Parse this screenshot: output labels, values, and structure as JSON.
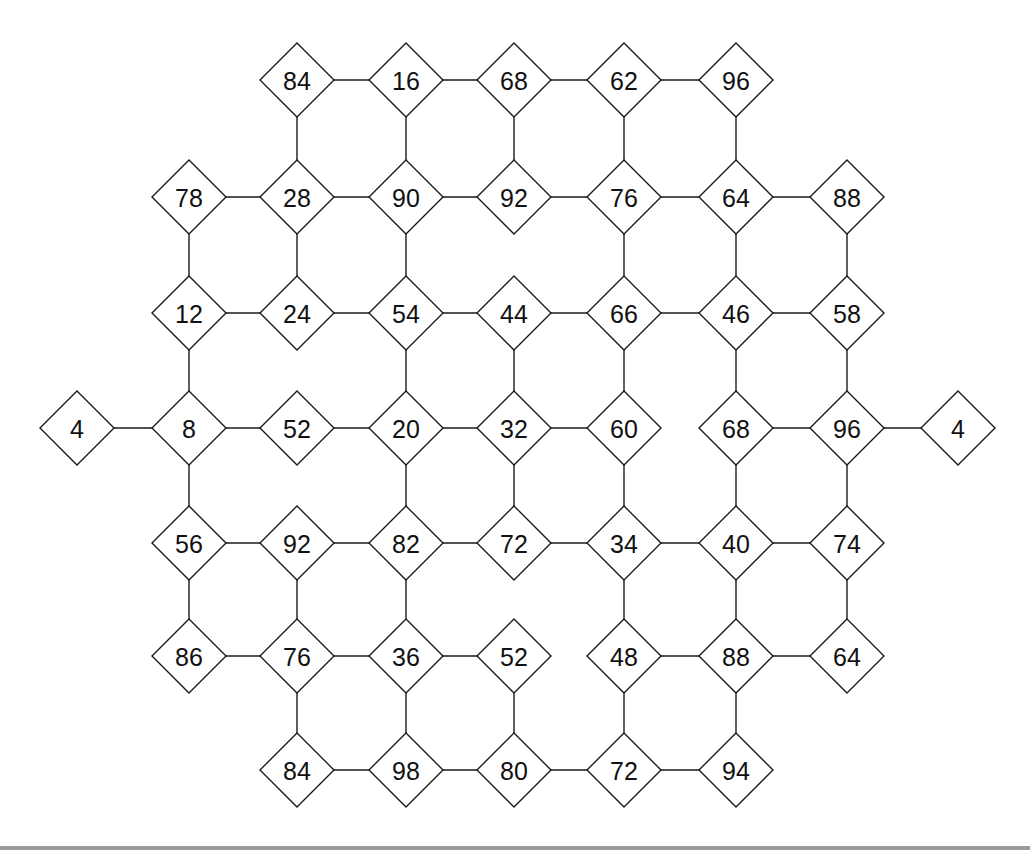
{
  "diagram": {
    "type": "number-grid-graph",
    "node_shape": "diamond",
    "colors": {
      "stroke": "#1a1a1a",
      "fill": "#ffffff",
      "text": "#111111"
    },
    "columns_x": [
      77,
      189,
      297,
      406,
      514,
      624,
      736,
      847,
      958
    ],
    "rows_y": [
      80,
      197,
      313,
      428,
      543,
      656,
      770
    ],
    "nodes": [
      {
        "id": "r0c2",
        "row": 0,
        "col": 2,
        "label": "84"
      },
      {
        "id": "r0c3",
        "row": 0,
        "col": 3,
        "label": "16"
      },
      {
        "id": "r0c4",
        "row": 0,
        "col": 4,
        "label": "68"
      },
      {
        "id": "r0c5",
        "row": 0,
        "col": 5,
        "label": "62"
      },
      {
        "id": "r0c6",
        "row": 0,
        "col": 6,
        "label": "96"
      },
      {
        "id": "r1c1",
        "row": 1,
        "col": 1,
        "label": "78"
      },
      {
        "id": "r1c2",
        "row": 1,
        "col": 2,
        "label": "28"
      },
      {
        "id": "r1c3",
        "row": 1,
        "col": 3,
        "label": "90"
      },
      {
        "id": "r1c4",
        "row": 1,
        "col": 4,
        "label": "92"
      },
      {
        "id": "r1c5",
        "row": 1,
        "col": 5,
        "label": "76"
      },
      {
        "id": "r1c6",
        "row": 1,
        "col": 6,
        "label": "64"
      },
      {
        "id": "r1c7",
        "row": 1,
        "col": 7,
        "label": "88"
      },
      {
        "id": "r2c1",
        "row": 2,
        "col": 1,
        "label": "12"
      },
      {
        "id": "r2c2",
        "row": 2,
        "col": 2,
        "label": "24"
      },
      {
        "id": "r2c3",
        "row": 2,
        "col": 3,
        "label": "54"
      },
      {
        "id": "r2c4",
        "row": 2,
        "col": 4,
        "label": "44"
      },
      {
        "id": "r2c5",
        "row": 2,
        "col": 5,
        "label": "66"
      },
      {
        "id": "r2c6",
        "row": 2,
        "col": 6,
        "label": "46"
      },
      {
        "id": "r2c7",
        "row": 2,
        "col": 7,
        "label": "58"
      },
      {
        "id": "r3c0",
        "row": 3,
        "col": 0,
        "label": "4"
      },
      {
        "id": "r3c1",
        "row": 3,
        "col": 1,
        "label": "8"
      },
      {
        "id": "r3c2",
        "row": 3,
        "col": 2,
        "label": "52"
      },
      {
        "id": "r3c3",
        "row": 3,
        "col": 3,
        "label": "20"
      },
      {
        "id": "r3c4",
        "row": 3,
        "col": 4,
        "label": "32"
      },
      {
        "id": "r3c5",
        "row": 3,
        "col": 5,
        "label": "60"
      },
      {
        "id": "r3c6",
        "row": 3,
        "col": 6,
        "label": "68"
      },
      {
        "id": "r3c7",
        "row": 3,
        "col": 7,
        "label": "96"
      },
      {
        "id": "r3c8",
        "row": 3,
        "col": 8,
        "label": "4"
      },
      {
        "id": "r4c1",
        "row": 4,
        "col": 1,
        "label": "56"
      },
      {
        "id": "r4c2",
        "row": 4,
        "col": 2,
        "label": "92"
      },
      {
        "id": "r4c3",
        "row": 4,
        "col": 3,
        "label": "82"
      },
      {
        "id": "r4c4",
        "row": 4,
        "col": 4,
        "label": "72"
      },
      {
        "id": "r4c5",
        "row": 4,
        "col": 5,
        "label": "34"
      },
      {
        "id": "r4c6",
        "row": 4,
        "col": 6,
        "label": "40"
      },
      {
        "id": "r4c7",
        "row": 4,
        "col": 7,
        "label": "74"
      },
      {
        "id": "r5c1",
        "row": 5,
        "col": 1,
        "label": "86"
      },
      {
        "id": "r5c2",
        "row": 5,
        "col": 2,
        "label": "76"
      },
      {
        "id": "r5c3",
        "row": 5,
        "col": 3,
        "label": "36"
      },
      {
        "id": "r5c4",
        "row": 5,
        "col": 4,
        "label": "52"
      },
      {
        "id": "r5c5",
        "row": 5,
        "col": 5,
        "label": "48"
      },
      {
        "id": "r5c6",
        "row": 5,
        "col": 6,
        "label": "88"
      },
      {
        "id": "r5c7",
        "row": 5,
        "col": 7,
        "label": "64"
      },
      {
        "id": "r6c2",
        "row": 6,
        "col": 2,
        "label": "84"
      },
      {
        "id": "r6c3",
        "row": 6,
        "col": 3,
        "label": "98"
      },
      {
        "id": "r6c4",
        "row": 6,
        "col": 4,
        "label": "80"
      },
      {
        "id": "r6c5",
        "row": 6,
        "col": 5,
        "label": "72"
      },
      {
        "id": "r6c6",
        "row": 6,
        "col": 6,
        "label": "94"
      }
    ],
    "edges": [
      [
        "r0c2",
        "r0c3"
      ],
      [
        "r0c3",
        "r0c4"
      ],
      [
        "r0c4",
        "r0c5"
      ],
      [
        "r0c5",
        "r0c6"
      ],
      [
        "r0c2",
        "r1c2"
      ],
      [
        "r0c3",
        "r1c3"
      ],
      [
        "r0c4",
        "r1c4"
      ],
      [
        "r0c5",
        "r1c5"
      ],
      [
        "r0c6",
        "r1c6"
      ],
      [
        "r1c1",
        "r1c2"
      ],
      [
        "r1c2",
        "r1c3"
      ],
      [
        "r1c3",
        "r1c4"
      ],
      [
        "r1c4",
        "r1c5"
      ],
      [
        "r1c5",
        "r1c6"
      ],
      [
        "r1c6",
        "r1c7"
      ],
      [
        "r1c1",
        "r2c1"
      ],
      [
        "r1c2",
        "r2c2"
      ],
      [
        "r1c3",
        "r2c3"
      ],
      [
        "r1c5",
        "r2c5"
      ],
      [
        "r1c6",
        "r2c6"
      ],
      [
        "r1c7",
        "r2c7"
      ],
      [
        "r2c1",
        "r2c2"
      ],
      [
        "r2c2",
        "r2c3"
      ],
      [
        "r2c3",
        "r2c4"
      ],
      [
        "r2c4",
        "r2c5"
      ],
      [
        "r2c5",
        "r2c6"
      ],
      [
        "r2c6",
        "r2c7"
      ],
      [
        "r2c1",
        "r3c1"
      ],
      [
        "r2c3",
        "r3c3"
      ],
      [
        "r2c4",
        "r3c4"
      ],
      [
        "r2c5",
        "r3c5"
      ],
      [
        "r2c6",
        "r3c6"
      ],
      [
        "r2c7",
        "r3c7"
      ],
      [
        "r3c0",
        "r3c1"
      ],
      [
        "r3c1",
        "r3c2"
      ],
      [
        "r3c2",
        "r3c3"
      ],
      [
        "r3c3",
        "r3c4"
      ],
      [
        "r3c4",
        "r3c5"
      ],
      [
        "r3c6",
        "r3c7"
      ],
      [
        "r3c7",
        "r3c8"
      ],
      [
        "r3c1",
        "r4c1"
      ],
      [
        "r3c3",
        "r4c3"
      ],
      [
        "r3c4",
        "r4c4"
      ],
      [
        "r3c5",
        "r4c5"
      ],
      [
        "r3c6",
        "r4c6"
      ],
      [
        "r3c7",
        "r4c7"
      ],
      [
        "r4c1",
        "r4c2"
      ],
      [
        "r4c2",
        "r4c3"
      ],
      [
        "r4c3",
        "r4c4"
      ],
      [
        "r4c4",
        "r4c5"
      ],
      [
        "r4c5",
        "r4c6"
      ],
      [
        "r4c6",
        "r4c7"
      ],
      [
        "r4c1",
        "r5c1"
      ],
      [
        "r4c2",
        "r5c2"
      ],
      [
        "r4c3",
        "r5c3"
      ],
      [
        "r4c5",
        "r5c5"
      ],
      [
        "r4c6",
        "r5c6"
      ],
      [
        "r4c7",
        "r5c7"
      ],
      [
        "r5c1",
        "r5c2"
      ],
      [
        "r5c2",
        "r5c3"
      ],
      [
        "r5c3",
        "r5c4"
      ],
      [
        "r5c5",
        "r5c6"
      ],
      [
        "r5c6",
        "r5c7"
      ],
      [
        "r5c2",
        "r6c2"
      ],
      [
        "r5c3",
        "r6c3"
      ],
      [
        "r5c4",
        "r6c4"
      ],
      [
        "r5c5",
        "r6c5"
      ],
      [
        "r5c6",
        "r6c6"
      ],
      [
        "r6c2",
        "r6c3"
      ],
      [
        "r6c3",
        "r6c4"
      ],
      [
        "r6c4",
        "r6c5"
      ],
      [
        "r6c5",
        "r6c6"
      ]
    ]
  }
}
